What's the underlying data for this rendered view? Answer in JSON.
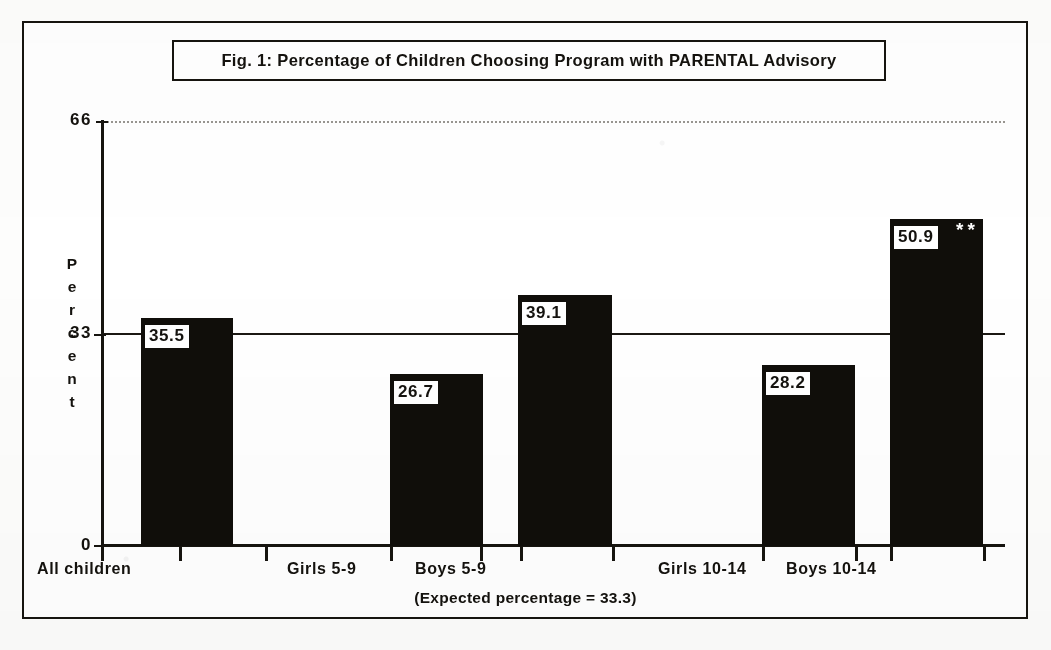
{
  "figure": {
    "title": "Fig. 1:   Percentage of Children Choosing Program with PARENTAL Advisory",
    "note": "(Expected percentage = 33.3)"
  },
  "axis": {
    "y_label_letters": [
      "P",
      "e",
      "r",
      "c",
      "e",
      "n",
      "t"
    ],
    "y_ticks": [
      "66",
      "33",
      "0"
    ]
  },
  "chart_data": {
    "type": "bar",
    "title": "Fig. 1:   Percentage of Children Choosing Program with PARENTAL Advisory",
    "xlabel": "",
    "ylabel": "Percent",
    "ylim": [
      0,
      66
    ],
    "yticks": [
      0,
      33,
      66
    ],
    "grid": false,
    "legend": "none",
    "annotations": [
      "(Expected percentage = 33.3)",
      "** on Boys 10-14"
    ],
    "reference_lines": [
      {
        "value": 33.3,
        "style": "solid",
        "label": "Expected percentage = 33.3"
      },
      {
        "value": 66,
        "style": "dotted",
        "label": ""
      }
    ],
    "categories": [
      "All children",
      "Girls  5-9",
      "Boys  5-9",
      "Girls  10-14",
      "Boys  10-14"
    ],
    "values": [
      35.5,
      26.7,
      39.1,
      28.2,
      50.9
    ],
    "value_labels": [
      "35.5",
      "26.7",
      "39.1",
      "28.2",
      "50.9"
    ],
    "significance": [
      "",
      "",
      "",
      "",
      "**"
    ],
    "bar_color": "#100e0a",
    "bars": [
      {
        "label": "All children",
        "value": 35.5,
        "value_label": "35.5",
        "significance": "",
        "left": 141,
        "width": 92
      },
      {
        "label": "Girls  5-9",
        "value": 26.7,
        "value_label": "26.7",
        "significance": "",
        "left": 390,
        "width": 93
      },
      {
        "label": "Boys  5-9",
        "value": 39.1,
        "value_label": "39.1",
        "significance": "",
        "left": 518,
        "width": 94
      },
      {
        "label": "Girls  10-14",
        "value": 28.2,
        "value_label": "28.2",
        "significance": "",
        "left": 762,
        "width": 93
      },
      {
        "label": "Boys  10-14",
        "value": 50.9,
        "value_label": "50.9",
        "significance": "**",
        "left": 890,
        "width": 93
      }
    ],
    "x_tick_positions": [
      101,
      179,
      265,
      390,
      480,
      520,
      612,
      762,
      855,
      890,
      983
    ],
    "x_label_positions": [
      {
        "label": "All children",
        "center": 187
      },
      {
        "label": "Girls  5-9",
        "center": 437
      },
      {
        "label": "Boys  5-9",
        "center": 565
      },
      {
        "label": "Girls  10-14",
        "center": 808
      },
      {
        "label": "Boys  10-14",
        "center": 936
      }
    ]
  }
}
